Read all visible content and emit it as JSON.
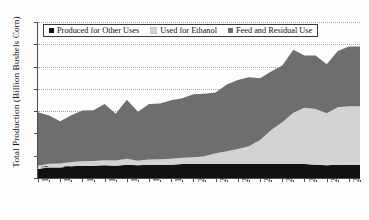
{
  "chart_data": {
    "type": "area",
    "stacked": true,
    "title": "",
    "subtitle": "",
    "xlabel": "",
    "ylabel": "Total Production (Billion Bushels Corn)",
    "ylim": [
      0,
      14
    ],
    "yticks": [
      0,
      2,
      4,
      6,
      8,
      10,
      12,
      14
    ],
    "xlim": [
      1986,
      2015
    ],
    "xticks": [
      1986,
      1988,
      1990,
      1992,
      1994,
      1996,
      1998,
      2000,
      2002,
      2004,
      2006,
      2008,
      2010,
      2012,
      2014
    ],
    "xtick_labels": [
      "1986",
      "1988",
      "1990",
      "1992",
      "1994",
      "1996",
      "1998",
      "2000",
      "2002",
      "2004",
      "2006",
      "2008",
      "2010",
      "2012",
      "2014"
    ],
    "grid": "horizontal-dotted",
    "legend_position": "top-left-inside",
    "x": [
      1986,
      1987,
      1988,
      1989,
      1990,
      1991,
      1992,
      1993,
      1994,
      1995,
      1996,
      1997,
      1998,
      1999,
      2000,
      2001,
      2002,
      2003,
      2004,
      2005,
      2006,
      2007,
      2008,
      2009,
      2010,
      2011,
      2012,
      2013,
      2014,
      2015
    ],
    "series": [
      {
        "name": "Produced for Other Uses",
        "color": "#111111",
        "values": [
          0.8,
          0.95,
          0.95,
          1.05,
          1.1,
          1.1,
          1.15,
          1.1,
          1.2,
          1.15,
          1.2,
          1.2,
          1.2,
          1.25,
          1.25,
          1.25,
          1.25,
          1.25,
          1.25,
          1.25,
          1.25,
          1.25,
          1.25,
          1.25,
          1.25,
          1.2,
          1.15,
          1.2,
          1.2,
          1.2
        ]
      },
      {
        "name": "Used for Ethanol",
        "color": "#d3d3d3",
        "values": [
          0.3,
          0.32,
          0.35,
          0.38,
          0.4,
          0.42,
          0.45,
          0.47,
          0.52,
          0.4,
          0.45,
          0.48,
          0.52,
          0.56,
          0.62,
          0.7,
          0.98,
          1.15,
          1.35,
          1.6,
          2.15,
          3.05,
          3.75,
          4.6,
          5.05,
          5.0,
          4.65,
          5.15,
          5.25,
          5.25
        ]
      },
      {
        "name": "Feed and Residual Use",
        "color": "#6e6e6e",
        "values": [
          4.8,
          4.35,
          3.8,
          4.2,
          4.55,
          4.55,
          5.05,
          4.2,
          5.3,
          4.4,
          5.0,
          5.0,
          5.25,
          5.35,
          5.65,
          5.6,
          5.45,
          6.0,
          6.2,
          6.2,
          5.55,
          5.25,
          5.1,
          5.65,
          4.7,
          4.8,
          4.4,
          5.05,
          5.35,
          5.35
        ]
      }
    ],
    "totals": [
      5.9,
      5.62,
      5.1,
      5.63,
      6.05,
      6.07,
      6.65,
      5.77,
      7.02,
      5.95,
      6.65,
      6.68,
      6.97,
      7.16,
      7.52,
      7.55,
      7.68,
      8.4,
      8.8,
      9.05,
      8.95,
      9.55,
      10.1,
      11.5,
      11.0,
      11.0,
      10.2,
      11.4,
      11.8,
      11.8
    ]
  },
  "legend": {
    "items": [
      {
        "label": "Produced for Other Uses",
        "color": "#111111"
      },
      {
        "label": "Used for Ethanol",
        "color": "#d3d3d3"
      },
      {
        "label": "Feed and Residual Use",
        "color": "#6e6e6e"
      }
    ]
  },
  "caption": {
    "text": ""
  }
}
